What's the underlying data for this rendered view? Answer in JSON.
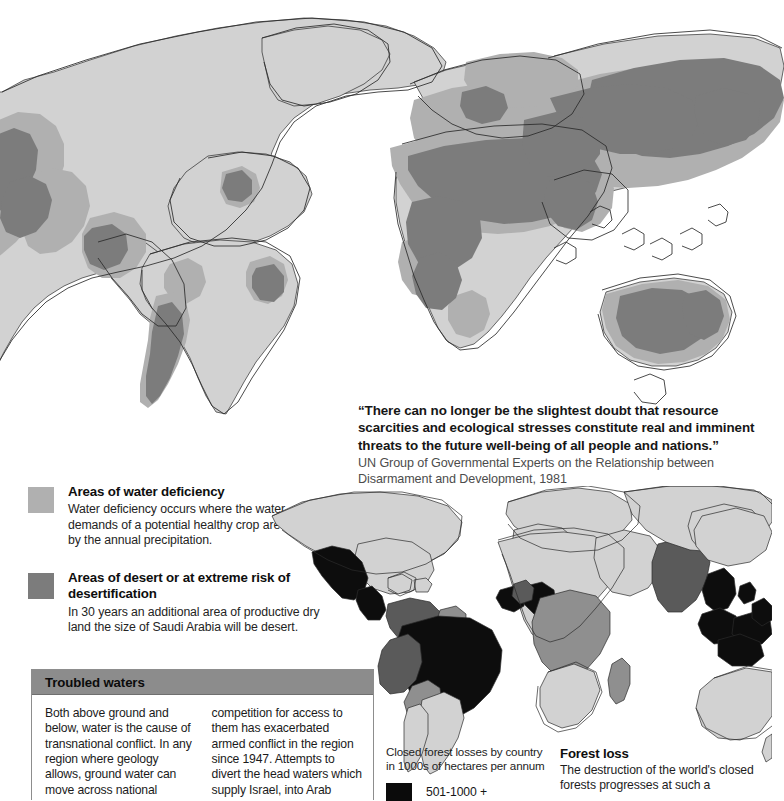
{
  "quote": {
    "text": "“There can no longer be the slightest doubt that resource scarcities and ecological stresses constitute real and imminent threats to the future well-being of all people and nations.”",
    "source": "UN Group of Governmental Experts on the Relationship between Disarmament and Development, 1981"
  },
  "water_legend": {
    "items": [
      {
        "swatch_color": "#b0b0b0",
        "title": "Areas of water deficiency",
        "description": "Water deficiency occurs where the water demands of a potential healthy crop are not met by the annual precipitation."
      },
      {
        "swatch_color": "#7c7c7c",
        "title": "Areas of desert or at extreme risk of desertification",
        "description": "In 30 years an additional area of productive dry land the size of Saudi Arabia will be desert."
      }
    ]
  },
  "troubled_waters": {
    "title": "Troubled waters",
    "header_color": "#8c8c8c",
    "column_1": "Both above ground and below, water is the cause of transnational conflict. In any region where geology allows, ground water can move across national borders, causing disputes over withdrawal rights",
    "column_2": "competition for access to them has exacerbated armed conflict in the region since 1947. Attempts to divert the head waters which supply Israel, into Arab rivers was a contributory factor in the"
  },
  "forest_legend": {
    "caption_line_1": "Closed forest losses by country",
    "caption_line_2": "in 1000s of hectares per annum",
    "key_color": "#0b0b0b",
    "key_label": "501-1000 +"
  },
  "forest_note": {
    "title": "Forest loss",
    "body": "The destruction of the world's closed forests progresses at such a"
  },
  "map_colors": {
    "land": "#d2d2d2",
    "deficiency": "#b0b0b0",
    "desert": "#7c7c7c",
    "outline": "#2b2b2b",
    "forest_high": "#0d0d0d",
    "forest_mid": "#5a5a5a",
    "forest_low": "#8f8f8f",
    "background": "#ffffff"
  }
}
